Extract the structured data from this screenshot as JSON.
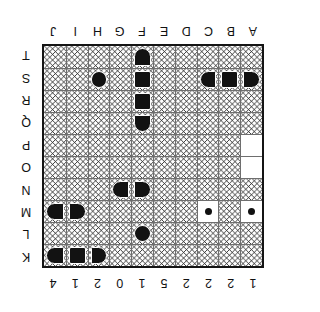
{
  "board": {
    "title": "Battleship Board",
    "orientation_note": "sheet printed upside down",
    "rows": 10,
    "cols": 10,
    "column_labels": [
      "A",
      "B",
      "C",
      "D",
      "E",
      "F",
      "G",
      "H",
      "I",
      "J"
    ],
    "row_numbers": [
      "1",
      "2",
      "2",
      "2",
      "5",
      "1",
      "0",
      "2",
      "1",
      "4"
    ],
    "row_letters": [
      "K",
      "L",
      "M",
      "N",
      "O",
      "P",
      "Q",
      "R",
      "S",
      "T"
    ],
    "colors": {
      "ship_fill": "#121212",
      "water_line": "#2b2b2b",
      "grid_line": "#6e6e6e",
      "frame": "#141414",
      "paper": "#ffffff"
    }
  },
  "cells": [
    [
      {
        "t": "water"
      },
      {
        "t": "water"
      },
      {
        "t": "water"
      },
      {
        "t": "water"
      },
      {
        "t": "water"
      },
      {
        "t": "water"
      },
      {
        "t": "water"
      },
      {
        "t": "ship",
        "s": "cap-left"
      },
      {
        "t": "ship",
        "s": "mid-h"
      },
      {
        "t": "ship",
        "s": "cap-right"
      }
    ],
    [
      {
        "t": "water"
      },
      {
        "t": "water"
      },
      {
        "t": "water"
      },
      {
        "t": "water"
      },
      {
        "t": "water"
      },
      {
        "t": "ship",
        "s": "round"
      },
      {
        "t": "water"
      },
      {
        "t": "water"
      },
      {
        "t": "water"
      },
      {
        "t": "water"
      }
    ],
    [
      {
        "t": "miss"
      },
      {
        "t": "water"
      },
      {
        "t": "miss"
      },
      {
        "t": "water"
      },
      {
        "t": "water"
      },
      {
        "t": "water"
      },
      {
        "t": "water"
      },
      {
        "t": "water"
      },
      {
        "t": "ship",
        "s": "cap-left"
      },
      {
        "t": "ship",
        "s": "cap-right"
      }
    ],
    [
      {
        "t": "water"
      },
      {
        "t": "water"
      },
      {
        "t": "water"
      },
      {
        "t": "water"
      },
      {
        "t": "water"
      },
      {
        "t": "ship",
        "s": "cap-left"
      },
      {
        "t": "ship",
        "s": "cap-right"
      },
      {
        "t": "water"
      },
      {
        "t": "water"
      },
      {
        "t": "water"
      }
    ],
    [
      {
        "t": "blank"
      },
      {
        "t": "water"
      },
      {
        "t": "water"
      },
      {
        "t": "water"
      },
      {
        "t": "water"
      },
      {
        "t": "water"
      },
      {
        "t": "water"
      },
      {
        "t": "water"
      },
      {
        "t": "water"
      },
      {
        "t": "water"
      }
    ],
    [
      {
        "t": "blank"
      },
      {
        "t": "water"
      },
      {
        "t": "water"
      },
      {
        "t": "water"
      },
      {
        "t": "water"
      },
      {
        "t": "water"
      },
      {
        "t": "water"
      },
      {
        "t": "water"
      },
      {
        "t": "water"
      },
      {
        "t": "water"
      }
    ],
    [
      {
        "t": "water"
      },
      {
        "t": "water"
      },
      {
        "t": "water"
      },
      {
        "t": "water"
      },
      {
        "t": "water"
      },
      {
        "t": "ship",
        "s": "cap-top"
      },
      {
        "t": "water"
      },
      {
        "t": "water"
      },
      {
        "t": "water"
      },
      {
        "t": "water"
      }
    ],
    [
      {
        "t": "water"
      },
      {
        "t": "water"
      },
      {
        "t": "water"
      },
      {
        "t": "water"
      },
      {
        "t": "water"
      },
      {
        "t": "ship",
        "s": "mid-v"
      },
      {
        "t": "water"
      },
      {
        "t": "water"
      },
      {
        "t": "water"
      },
      {
        "t": "water"
      }
    ],
    [
      {
        "t": "ship",
        "s": "cap-left"
      },
      {
        "t": "ship",
        "s": "mid-h"
      },
      {
        "t": "ship",
        "s": "cap-right"
      },
      {
        "t": "water"
      },
      {
        "t": "water"
      },
      {
        "t": "ship",
        "s": "mid-v"
      },
      {
        "t": "water"
      },
      {
        "t": "ship",
        "s": "round"
      },
      {
        "t": "water"
      },
      {
        "t": "water"
      }
    ],
    [
      {
        "t": "water"
      },
      {
        "t": "water"
      },
      {
        "t": "water"
      },
      {
        "t": "water"
      },
      {
        "t": "water"
      },
      {
        "t": "ship",
        "s": "cap-bot"
      },
      {
        "t": "water"
      },
      {
        "t": "water"
      },
      {
        "t": "water"
      },
      {
        "t": "water"
      }
    ]
  ]
}
